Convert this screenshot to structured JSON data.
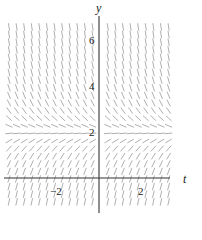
{
  "diagram": {
    "type": "slope-field",
    "equation_form": "dy/dt = 2 - y",
    "equilibrium": 2,
    "x_axis": {
      "label": "t",
      "range": [
        -4.5,
        3.6
      ],
      "ticks": [
        {
          "value": -2,
          "label": "−2"
        },
        {
          "value": 2,
          "label": "2"
        }
      ]
    },
    "y_axis": {
      "label": "y",
      "range": [
        -1.5,
        7.5
      ],
      "ticks": [
        {
          "value": 2,
          "label": "2"
        },
        {
          "value": 4,
          "label": "4"
        },
        {
          "value": 6,
          "label": "6"
        }
      ]
    },
    "grid": {
      "t_step": 0.35,
      "y_step": 0.33
    },
    "colors": {
      "segments": "#9a9a9a",
      "axes": "#333333",
      "text": "#222222"
    }
  }
}
